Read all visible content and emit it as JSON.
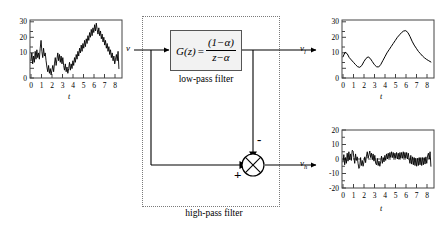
{
  "diagram": {
    "input_signal_label": "v",
    "lowpass_output_label": "v",
    "lowpass_output_sub": "l",
    "highpass_output_label": "v",
    "highpass_output_sub": "h",
    "block": {
      "function_name": "G",
      "function_arg": "z",
      "equals": "=",
      "numerator": "(1−α)",
      "denominator": "z−α",
      "caption": "low-pass filter"
    },
    "region_caption": "high-pass filter",
    "summing_junction": {
      "minus_sign": "-",
      "plus_sign": "+",
      "name": "summing-junction"
    },
    "colors": {
      "line": "#000000",
      "block_fill": "#f2f2f2",
      "block_border": "#555555",
      "dotted_border": "#7a7a7a",
      "axis": "#444444"
    }
  },
  "chart_data": [
    {
      "id": "input-signal-chart",
      "type": "line",
      "title": "",
      "xlabel": "t",
      "ylabel": "",
      "xlim": [
        0,
        8.6
      ],
      "ylim": [
        0,
        37
      ],
      "xticks": [
        0,
        1,
        2,
        3,
        4,
        5,
        6,
        7,
        8
      ],
      "yticks": [
        0,
        10,
        20,
        30
      ],
      "yticklabels": [
        "0",
        "10",
        "20",
        "30"
      ],
      "grid": false,
      "legend": null,
      "series": [
        {
          "name": "v",
          "x": [
            0.0,
            0.08,
            0.16,
            0.24,
            0.32,
            0.4,
            0.48,
            0.56,
            0.64,
            0.72,
            0.8,
            0.88,
            0.96,
            1.04,
            1.12,
            1.2,
            1.28,
            1.36,
            1.44,
            1.52,
            1.6,
            1.68,
            1.76,
            1.84,
            1.92,
            2.0,
            2.08,
            2.16,
            2.24,
            2.32,
            2.4,
            2.48,
            2.56,
            2.64,
            2.72,
            2.8,
            2.88,
            2.96,
            3.04,
            3.12,
            3.2,
            3.28,
            3.36,
            3.44,
            3.52,
            3.6,
            3.68,
            3.76,
            3.84,
            3.92,
            4.0,
            4.08,
            4.16,
            4.24,
            4.32,
            4.4,
            4.48,
            4.56,
            4.64,
            4.72,
            4.8,
            4.88,
            4.96,
            5.04,
            5.12,
            5.2,
            5.28,
            5.36,
            5.44,
            5.52,
            5.6,
            5.68,
            5.76,
            5.84,
            5.92,
            6.0,
            6.08,
            6.16,
            6.24,
            6.32,
            6.4,
            6.48,
            6.56,
            6.64,
            6.72,
            6.8,
            6.88,
            6.96,
            7.04,
            7.12,
            7.2,
            7.28,
            7.36,
            7.44,
            7.52,
            7.6,
            7.68,
            7.76,
            7.84,
            7.92,
            8.0,
            8.08,
            8.16,
            8.24,
            8.32,
            8.4
          ],
          "y": [
            11,
            16,
            9,
            14,
            10,
            17,
            12,
            18,
            13,
            16,
            12,
            19,
            24,
            17,
            13,
            19,
            14,
            16,
            11,
            7,
            4,
            8,
            3,
            6,
            2,
            5,
            8,
            4,
            9,
            13,
            8,
            12,
            16,
            11,
            15,
            10,
            14,
            9,
            13,
            8,
            5,
            9,
            4,
            7,
            3,
            6,
            10,
            5,
            9,
            6,
            11,
            8,
            13,
            10,
            15,
            12,
            17,
            14,
            19,
            16,
            21,
            17,
            22,
            19,
            24,
            20,
            25,
            22,
            27,
            24,
            29,
            26,
            31,
            27,
            32,
            29,
            34,
            30,
            35,
            31,
            28,
            32,
            27,
            30,
            25,
            28,
            23,
            26,
            21,
            24,
            19,
            22,
            17,
            20,
            15,
            18,
            13,
            16,
            11,
            14,
            9,
            12,
            15,
            11,
            17,
            6
          ]
        }
      ]
    },
    {
      "id": "lowpass-output-chart",
      "type": "line",
      "title": "",
      "xlabel": "t",
      "ylabel": "",
      "xlim": [
        0,
        8.6
      ],
      "ylim": [
        0,
        37
      ],
      "xticks": [
        0,
        1,
        2,
        3,
        4,
        5,
        6,
        7,
        8
      ],
      "yticks": [
        0,
        10,
        20,
        30
      ],
      "yticklabels": [
        "0",
        "10",
        "20",
        "30"
      ],
      "grid": false,
      "legend": null,
      "series": [
        {
          "name": "v_l",
          "x": [
            0.0,
            0.2,
            0.4,
            0.6,
            0.8,
            1.0,
            1.2,
            1.4,
            1.6,
            1.8,
            2.0,
            2.2,
            2.4,
            2.6,
            2.8,
            3.0,
            3.2,
            3.4,
            3.6,
            3.8,
            4.0,
            4.2,
            4.4,
            4.6,
            4.8,
            5.0,
            5.2,
            5.4,
            5.6,
            5.8,
            6.0,
            6.2,
            6.4,
            6.6,
            6.8,
            7.0,
            7.2,
            7.4,
            7.6,
            7.8,
            8.0,
            8.2,
            8.4
          ],
          "y": [
            13.5,
            16.5,
            15.5,
            13.0,
            11.5,
            10.0,
            8.5,
            7.2,
            6.8,
            8.0,
            10.5,
            12.5,
            13.5,
            12.5,
            10.5,
            8.5,
            7.2,
            7.0,
            8.5,
            11.0,
            13.5,
            16.0,
            18.0,
            20.0,
            22.0,
            24.0,
            26.0,
            27.5,
            29.0,
            30.0,
            30.2,
            29.0,
            26.5,
            23.5,
            21.0,
            19.0,
            17.0,
            15.5,
            14.0,
            12.8,
            11.8,
            11.0,
            10.2
          ]
        }
      ]
    },
    {
      "id": "highpass-output-chart",
      "type": "line",
      "title": "",
      "xlabel": "t",
      "ylabel": "",
      "xlim": [
        0,
        8.6
      ],
      "ylim": [
        -20,
        20
      ],
      "xticks": [
        0,
        1,
        2,
        3,
        4,
        5,
        6,
        7,
        8
      ],
      "yticks": [
        -20,
        -10,
        0,
        10,
        20
      ],
      "yticklabels": [
        "-20",
        "-10",
        "0",
        "10",
        "20"
      ],
      "grid": false,
      "zero_line": true,
      "legend": null,
      "series": [
        {
          "name": "v_h",
          "x": [
            0.0,
            0.08,
            0.16,
            0.24,
            0.32,
            0.4,
            0.48,
            0.56,
            0.64,
            0.72,
            0.8,
            0.88,
            0.96,
            1.04,
            1.12,
            1.2,
            1.28,
            1.36,
            1.44,
            1.52,
            1.6,
            1.68,
            1.76,
            1.84,
            1.92,
            2.0,
            2.08,
            2.16,
            2.24,
            2.32,
            2.4,
            2.48,
            2.56,
            2.64,
            2.72,
            2.8,
            2.88,
            2.96,
            3.04,
            3.12,
            3.2,
            3.28,
            3.36,
            3.44,
            3.52,
            3.6,
            3.68,
            3.76,
            3.84,
            3.92,
            4.0,
            4.08,
            4.16,
            4.24,
            4.32,
            4.4,
            4.48,
            4.56,
            4.64,
            4.72,
            4.8,
            4.88,
            4.96,
            5.04,
            5.12,
            5.2,
            5.28,
            5.36,
            5.44,
            5.52,
            5.6,
            5.68,
            5.76,
            5.84,
            5.92,
            6.0,
            6.08,
            6.16,
            6.24,
            6.32,
            6.4,
            6.48,
            6.56,
            6.64,
            6.72,
            6.8,
            6.88,
            6.96,
            7.04,
            7.12,
            7.2,
            7.28,
            7.36,
            7.44,
            7.52,
            7.6,
            7.68,
            7.76,
            7.84,
            7.92,
            8.0,
            8.08,
            8.16,
            8.24,
            8.32,
            8.4
          ],
          "y": [
            -2.0,
            3.0,
            -4.0,
            1.0,
            -3.0,
            4.0,
            -1.5,
            5.0,
            -0.5,
            3.5,
            -1.0,
            6.0,
            5.5,
            1.0,
            -3.0,
            3.5,
            -1.0,
            1.5,
            -3.0,
            -6.5,
            -5.0,
            1.0,
            -4.5,
            -1.0,
            -5.0,
            -2.0,
            1.5,
            -2.5,
            2.0,
            5.0,
            0.5,
            3.0,
            5.5,
            1.0,
            4.0,
            -0.5,
            3.5,
            -1.5,
            2.5,
            -3.0,
            -4.0,
            0.5,
            -4.5,
            -1.5,
            -5.0,
            -2.0,
            2.0,
            -3.0,
            1.0,
            -2.0,
            2.5,
            -1.0,
            3.5,
            0.0,
            4.0,
            0.5,
            4.5,
            1.0,
            5.0,
            1.0,
            4.5,
            0.5,
            4.0,
            0.5,
            4.5,
            0.0,
            4.0,
            0.0,
            4.5,
            0.5,
            4.5,
            0.5,
            5.0,
            0.5,
            4.5,
            0.5,
            4.5,
            0.0,
            4.0,
            0.0,
            -3.0,
            2.5,
            -3.5,
            1.5,
            -4.0,
            1.0,
            -4.5,
            0.5,
            -5.0,
            0.5,
            -4.5,
            1.0,
            -4.0,
            1.0,
            -4.5,
            1.0,
            -4.0,
            1.0,
            -3.5,
            1.5,
            -3.0,
            2.0,
            4.0,
            0.0,
            5.0,
            -5.0
          ]
        }
      ]
    }
  ]
}
